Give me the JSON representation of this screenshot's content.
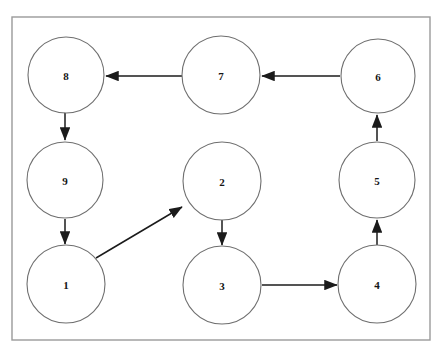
{
  "diagram": {
    "type": "directed-graph",
    "canvas": {
      "width": 445,
      "height": 353
    },
    "colors": {
      "page_background": "#ffffff",
      "frame_background": "#ffffff",
      "frame_stroke": "#9a9a9a",
      "node_fill": "#ffffff",
      "node_stroke": "#6f6f6f",
      "node_label": "#151515",
      "edge_stroke": "#1b1b1b"
    },
    "frame": {
      "x": 12,
      "y": 17,
      "width": 418,
      "height": 323
    },
    "nodes": [
      {
        "id": "8",
        "label": "8",
        "cx": 66,
        "cy": 75,
        "r": 38
      },
      {
        "id": "7",
        "label": "7",
        "cx": 221,
        "cy": 75,
        "r": 39
      },
      {
        "id": "6",
        "label": "6",
        "cx": 378,
        "cy": 76,
        "r": 37
      },
      {
        "id": "9",
        "label": "9",
        "cx": 65,
        "cy": 180,
        "r": 38
      },
      {
        "id": "2",
        "label": "2",
        "cx": 222,
        "cy": 181,
        "r": 39
      },
      {
        "id": "5",
        "label": "5",
        "cx": 377,
        "cy": 180,
        "r": 38
      },
      {
        "id": "1",
        "label": "1",
        "cx": 66,
        "cy": 284,
        "r": 39
      },
      {
        "id": "3",
        "label": "3",
        "cx": 222,
        "cy": 285,
        "r": 39
      },
      {
        "id": "4",
        "label": "4",
        "cx": 377,
        "cy": 284,
        "r": 39
      }
    ],
    "edges": [
      {
        "id": "e7-8",
        "from": "7",
        "to": "8",
        "x1": 182,
        "y1": 76,
        "x2": 106,
        "y2": 76,
        "direction": "left"
      },
      {
        "id": "e6-7",
        "from": "6",
        "to": "7",
        "x1": 340,
        "y1": 76,
        "x2": 262,
        "y2": 76,
        "direction": "left"
      },
      {
        "id": "e8-9",
        "from": "8",
        "to": "9",
        "x1": 65,
        "y1": 112,
        "x2": 65,
        "y2": 140,
        "direction": "down"
      },
      {
        "id": "e9-1",
        "from": "9",
        "to": "1",
        "x1": 65,
        "y1": 219,
        "x2": 65,
        "y2": 244,
        "direction": "down"
      },
      {
        "id": "e1-2",
        "from": "1",
        "to": "2",
        "x1": 96,
        "y1": 258,
        "x2": 182,
        "y2": 207,
        "direction": "diagonal-up-right"
      },
      {
        "id": "e2-3",
        "from": "2",
        "to": "3",
        "x1": 222,
        "y1": 220,
        "x2": 222,
        "y2": 245,
        "direction": "down"
      },
      {
        "id": "e3-4",
        "from": "3",
        "to": "4",
        "x1": 262,
        "y1": 285,
        "x2": 337,
        "y2": 285,
        "direction": "right"
      },
      {
        "id": "e4-5",
        "from": "4",
        "to": "5",
        "x1": 377,
        "y1": 245,
        "x2": 377,
        "y2": 220,
        "direction": "up"
      },
      {
        "id": "e5-6",
        "from": "5",
        "to": "6",
        "x1": 377,
        "y1": 141,
        "x2": 377,
        "y2": 115,
        "direction": "up"
      }
    ]
  }
}
